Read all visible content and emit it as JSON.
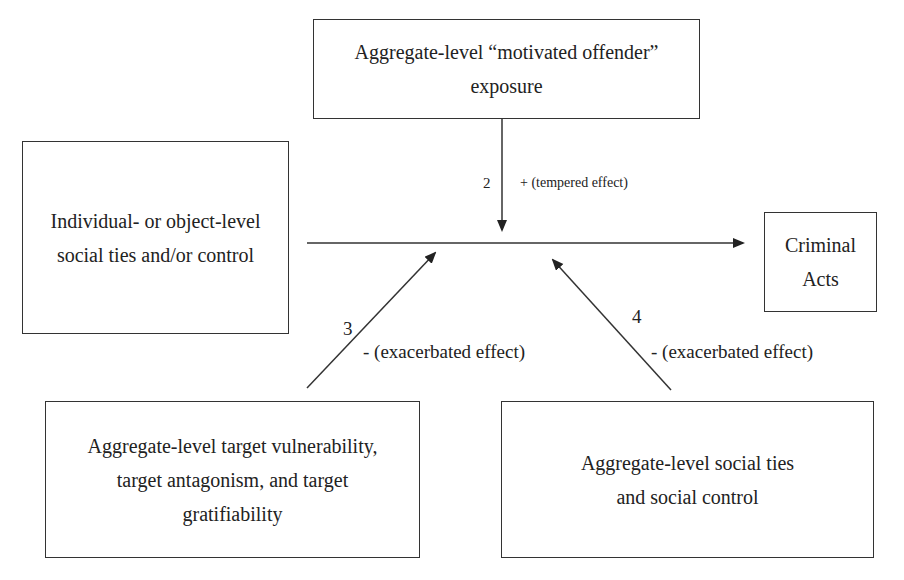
{
  "diagram": {
    "nodes": {
      "motivated_offender": {
        "lines": [
          "Aggregate-level “motivated offender”",
          "exposure"
        ]
      },
      "individual_ties": {
        "lines": [
          "Individual- or object-level",
          "social ties and/or control"
        ]
      },
      "criminal_acts": {
        "lines": [
          "Criminal",
          "Acts"
        ]
      },
      "target_vulnerability": {
        "lines": [
          "Aggregate-level target vulnerability,",
          "target antagonism, and target",
          "gratifiability"
        ]
      },
      "aggregate_ties": {
        "lines": [
          "Aggregate-level social ties",
          "and social control"
        ]
      }
    },
    "edges": {
      "main": {
        "from": "individual_ties",
        "to": "criminal_acts"
      },
      "moderator_2": {
        "number": "2",
        "effect": "+ (tempered effect)",
        "from": "motivated_offender"
      },
      "moderator_3": {
        "number": "3",
        "effect": "- (exacerbated effect)",
        "from": "target_vulnerability"
      },
      "moderator_4": {
        "number": "4",
        "effect": "- (exacerbated effect)",
        "from": "aggregate_ties"
      }
    },
    "colors": {
      "stroke": "#333333",
      "text": "#222222",
      "background": "#ffffff"
    }
  }
}
